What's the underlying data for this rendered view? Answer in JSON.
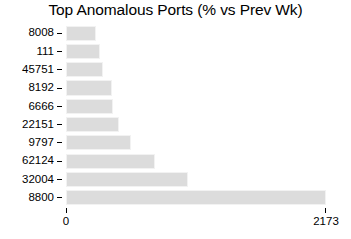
{
  "chart_data": {
    "type": "bar",
    "orientation": "horizontal",
    "title": "Top Anomalous Ports (% vs Prev Wk)",
    "xlabel": "",
    "ylabel": "",
    "categories": [
      "8008",
      "111",
      "45751",
      "8192",
      "6666",
      "22151",
      "9797",
      "62124",
      "32004",
      "8800"
    ],
    "values": [
      250,
      285,
      310,
      385,
      395,
      440,
      545,
      745,
      1020,
      2173
    ],
    "xlim": [
      0,
      2173
    ],
    "xticks": [
      0,
      2173
    ],
    "xtick_labels": [
      "0",
      "2173"
    ],
    "ytick_labels": [
      "8008",
      "111",
      "45751",
      "8192",
      "6666",
      "22151",
      "9797",
      "62124",
      "32004",
      "8800"
    ],
    "grid": false,
    "legend": null,
    "bar_color": "#dcdcdc",
    "bar_edge_color": "#f2f2f2",
    "background_color": "#ffffff",
    "text_color": "#000000"
  }
}
